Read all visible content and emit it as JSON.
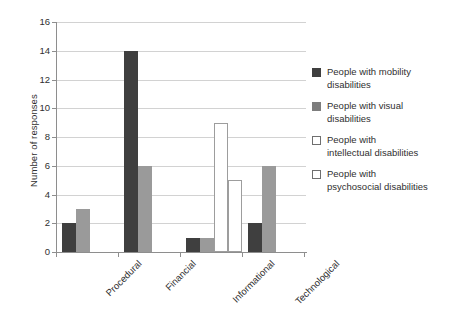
{
  "chart_data": {
    "type": "bar",
    "title": "",
    "xlabel": "",
    "ylabel": "Number of responses",
    "ylim": [
      0,
      16
    ],
    "ytick_step": 2,
    "yticks": [
      0,
      2,
      4,
      6,
      8,
      10,
      12,
      14,
      16
    ],
    "grid": true,
    "legend_position": "right",
    "categories": [
      "Procedural",
      "Financial",
      "Informational",
      "Technological"
    ],
    "series": [
      {
        "name": "People with mobility disabilities",
        "color": "#3f3f3f",
        "values": [
          2,
          14,
          1,
          2
        ]
      },
      {
        "name": "People with visual disabilities",
        "color": "#9a9a9a",
        "values": [
          3,
          6,
          1,
          6
        ]
      },
      {
        "name": "People with intellectual disabilities",
        "color": "#ffffff",
        "values": [
          0,
          0,
          9,
          0
        ]
      },
      {
        "name": "People with psychosocial disabilities",
        "color": "#ffffff",
        "values": [
          0,
          0,
          5,
          0
        ]
      }
    ]
  },
  "legend": {
    "items": [
      {
        "label_line1": "People with mobility",
        "label_line2": "disabilities",
        "swatch": "dark-swatch-icon"
      },
      {
        "label_line1": "People with visual",
        "label_line2": "disabilities",
        "swatch": "gray-swatch-icon"
      },
      {
        "label_line1": "People with",
        "label_line2": "intellectual disabilities",
        "swatch": "white-swatch-icon"
      },
      {
        "label_line1": "People with",
        "label_line2": "psychosocial disabilities",
        "swatch": "white-swatch-icon"
      }
    ]
  },
  "axis": {
    "y_title": "Number of responses",
    "y_tick_labels": [
      "0",
      "2",
      "4",
      "6",
      "8",
      "10",
      "12",
      "14",
      "16"
    ],
    "x_tick_labels": [
      "Procedural",
      "Financial",
      "Informational",
      "Technological"
    ]
  }
}
